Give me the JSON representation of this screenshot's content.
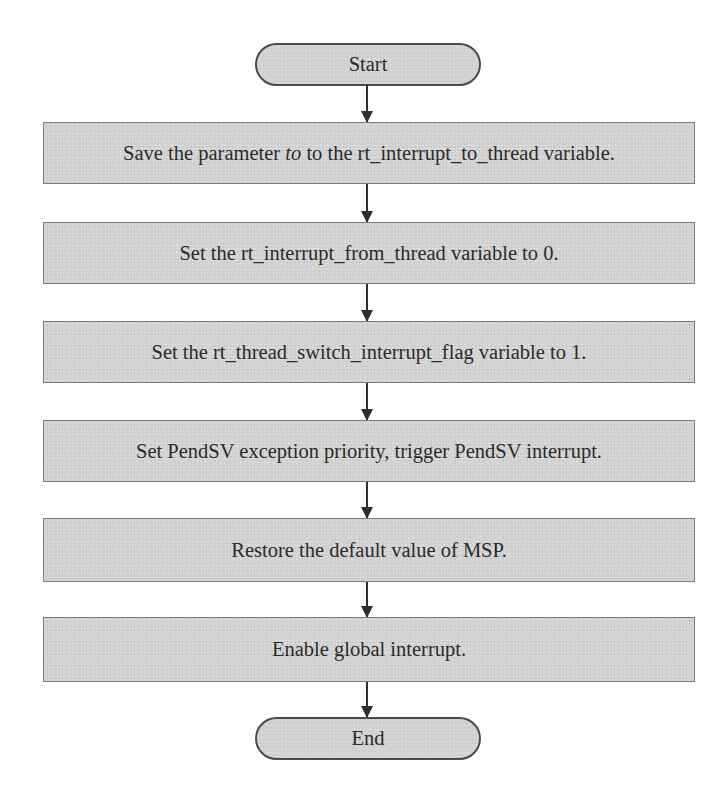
{
  "flowchart": {
    "start": {
      "label": "Start"
    },
    "steps": [
      {
        "pre": "Save the parameter ",
        "emph": "to",
        "post": " to the rt_interrupt_to_thread variable."
      },
      {
        "label": "Set the rt_interrupt_from_thread variable to 0."
      },
      {
        "label": "Set the rt_thread_switch_interrupt_flag variable to 1."
      },
      {
        "label": "Set PendSV exception priority, trigger PendSV interrupt."
      },
      {
        "label": "Restore the default value of MSP."
      },
      {
        "label": "Enable global interrupt."
      }
    ],
    "end": {
      "label": "End"
    }
  },
  "colors": {
    "box_fill": "#d3d3d3",
    "box_border": "#7c7c7c",
    "terminal_border": "#4a4a4a",
    "arrow": "#2e2e2e",
    "text": "#2b2b2b"
  }
}
